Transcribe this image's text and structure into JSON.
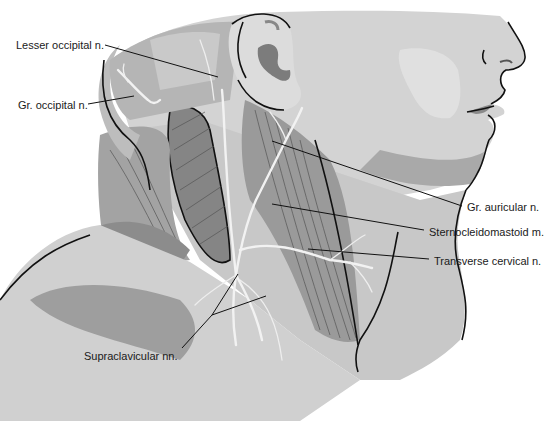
{
  "figure": {
    "colors": {
      "background": "#ffffff",
      "skin_light": "#d9d9d9",
      "skin_mid": "#c4c4c4",
      "skin_dark": "#a6a6a6",
      "muscle": "#8e8e8e",
      "muscle_dark": "#7a7a7a",
      "nerve": "#f2f2f2",
      "outline": "#111111",
      "label_text": "#1a1a1a"
    }
  },
  "labels": [
    {
      "id": "lesser-occipital",
      "text": "Lesser occipital n.",
      "x": 16,
      "y": 39
    },
    {
      "id": "greater-occipital",
      "text": "Gr. occipital n.",
      "x": 18,
      "y": 99
    },
    {
      "id": "greater-auricular",
      "text": "Gr. auricular n.",
      "x": 467,
      "y": 201
    },
    {
      "id": "sternocleidomastoid",
      "text": "Sternocleidomastoid m.",
      "x": 429,
      "y": 226
    },
    {
      "id": "transverse-cervical",
      "text": "Transverse cervical n.",
      "x": 434,
      "y": 255
    },
    {
      "id": "supraclavicular",
      "text": "Supraclavicular nn.",
      "x": 84,
      "y": 350
    }
  ]
}
